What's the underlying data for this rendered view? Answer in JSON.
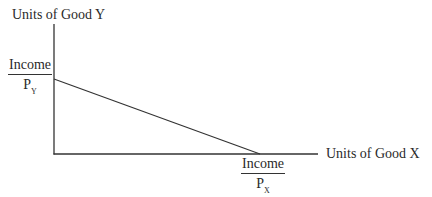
{
  "diagram": {
    "type": "budget-constraint",
    "colors": {
      "background": "#ffffff",
      "stroke": "#333333",
      "text": "#2a2a2a"
    },
    "y_axis": {
      "label": "Units of Good Y"
    },
    "x_axis": {
      "label": "Units of Good X"
    },
    "y_intercept": {
      "numerator": "Income",
      "denominator_base": "P",
      "denominator_sub": "Y"
    },
    "x_intercept": {
      "numerator": "Income",
      "denominator_base": "P",
      "denominator_sub": "X"
    },
    "geometry": {
      "origin": [
        54,
        154
      ],
      "y_axis_top": [
        54,
        24
      ],
      "x_axis_end": [
        318,
        154
      ],
      "budget_line_start": [
        54,
        79
      ],
      "budget_line_end": [
        260,
        154
      ]
    }
  }
}
